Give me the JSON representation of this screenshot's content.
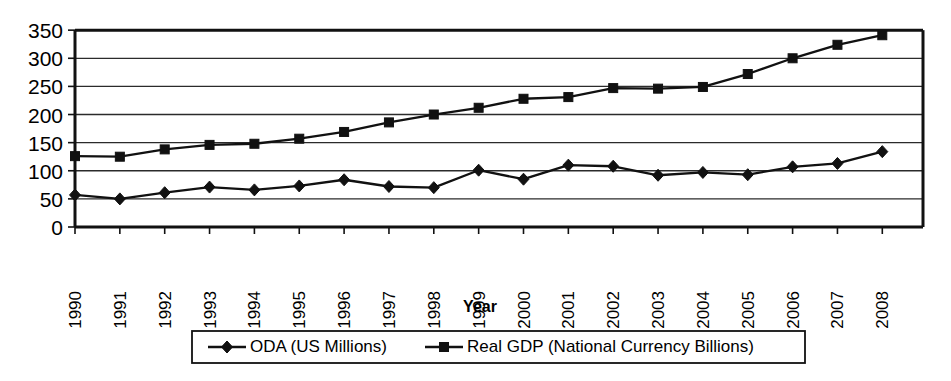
{
  "chart_data": {
    "type": "line",
    "title": "",
    "xlabel": "Year",
    "ylabel": "",
    "ylim": [
      0,
      350
    ],
    "ytick_step": 50,
    "yticks": [
      "0",
      "50",
      "100",
      "150",
      "200",
      "250",
      "300",
      "350"
    ],
    "grid": true,
    "legend_position": "bottom",
    "categories": [
      "1990",
      "1991",
      "1992",
      "1993",
      "1994",
      "1995",
      "1996",
      "1997",
      "1998",
      "1999",
      "2000",
      "2001",
      "2002",
      "2003",
      "2004",
      "2005",
      "2006",
      "2007",
      "2008"
    ],
    "series": [
      {
        "name": "ODA (US Millions)",
        "marker": "diamond",
        "color": "#111111",
        "values": [
          57,
          50,
          61,
          71,
          66,
          73,
          84,
          72,
          70,
          101,
          85,
          110,
          108,
          92,
          97,
          93,
          107,
          113,
          134
        ]
      },
      {
        "name": "Real GDP (National Currency Billions)",
        "marker": "square",
        "color": "#111111",
        "values": [
          126,
          125,
          138,
          146,
          148,
          157,
          169,
          186,
          200,
          212,
          228,
          231,
          247,
          246,
          249,
          272,
          300,
          324,
          341
        ]
      }
    ]
  },
  "axis": {
    "x_title": "Year"
  },
  "legend": {
    "items": [
      {
        "label": "ODA (US Millions)",
        "marker": "diamond-marker-icon"
      },
      {
        "label": "Real GDP (National Currency Billions)",
        "marker": "square-marker-icon"
      }
    ]
  }
}
